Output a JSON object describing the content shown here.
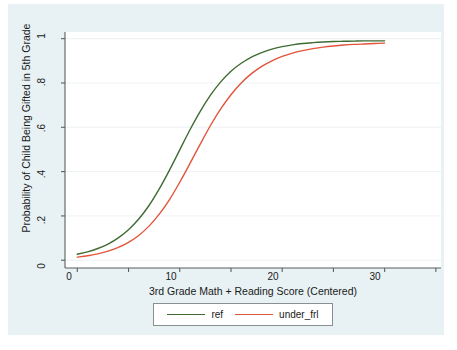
{
  "chart_data": {
    "type": "line",
    "title": "",
    "xlabel": "3rd Grade Math + Reading Score (Centered)",
    "ylabel": "Probability of Child Being Gifted in 5th Grade",
    "xlim": [
      -1.2,
      35.5
    ],
    "ylim": [
      -0.035,
      1.03
    ],
    "x_ticks": [
      0,
      10,
      20,
      30
    ],
    "x_tick_labels": [
      "0",
      "10",
      "20",
      "30"
    ],
    "x_minor_ticks": [
      5,
      15,
      25,
      35
    ],
    "y_ticks": [
      0,
      0.2,
      0.4,
      0.6,
      0.8,
      1
    ],
    "y_tick_labels": [
      "0",
      ".2",
      ".4",
      ".6",
      ".8",
      "1"
    ],
    "grid": "horizontal",
    "legend_position": "bottom",
    "series": [
      {
        "name": "ref",
        "color": "#3f6b33",
        "x": [
          0,
          1,
          2,
          3,
          4,
          5,
          6,
          7,
          8,
          9,
          10,
          11,
          12,
          13,
          14,
          15,
          16,
          17,
          18,
          19,
          20,
          21,
          22,
          23,
          24,
          25,
          26,
          27,
          28,
          29,
          30
        ],
        "y": [
          0.027,
          0.038,
          0.053,
          0.073,
          0.101,
          0.138,
          0.186,
          0.247,
          0.322,
          0.407,
          0.498,
          0.589,
          0.672,
          0.745,
          0.805,
          0.853,
          0.889,
          0.917,
          0.937,
          0.953,
          0.964,
          0.972,
          0.978,
          0.982,
          0.985,
          0.987,
          0.988,
          0.989,
          0.99,
          0.99,
          0.99
        ]
      },
      {
        "name": "under_frl",
        "color": "#e2553a",
        "x": [
          0,
          1,
          2,
          3,
          4,
          5,
          6,
          7,
          8,
          9,
          10,
          11,
          12,
          13,
          14,
          15,
          16,
          17,
          18,
          19,
          20,
          21,
          22,
          23,
          24,
          25,
          26,
          27,
          28,
          29,
          30
        ],
        "y": [
          0.014,
          0.02,
          0.029,
          0.041,
          0.058,
          0.081,
          0.112,
          0.154,
          0.208,
          0.274,
          0.352,
          0.437,
          0.524,
          0.608,
          0.683,
          0.747,
          0.8,
          0.842,
          0.875,
          0.9,
          0.92,
          0.935,
          0.946,
          0.955,
          0.962,
          0.967,
          0.971,
          0.974,
          0.976,
          0.978,
          0.98
        ]
      }
    ]
  },
  "axes": {
    "x_title": "3rd Grade Math + Reading Score (Centered)",
    "y_title": "Probability of Child Being Gifted in 5th Grade",
    "x_tick_labels": [
      "0",
      "10",
      "20",
      "30"
    ],
    "y_tick_labels": [
      "1",
      ".8",
      ".6",
      ".4",
      ".2",
      "0"
    ]
  },
  "legend": {
    "entries": [
      {
        "label": "ref",
        "color": "#3f6b33"
      },
      {
        "label": "under_frl",
        "color": "#e2553a"
      }
    ]
  },
  "colors": {
    "canvas_background": "#e8f1f3",
    "plot_background": "#ffffff",
    "axis_line": "#5a5f61",
    "grid_line": "#eef2f5",
    "text": "#1a1a1a",
    "series_ref": "#3f6b33",
    "series_under_frl": "#e2553a"
  }
}
